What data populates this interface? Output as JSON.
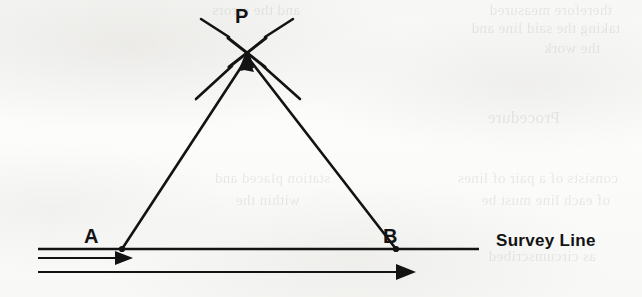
{
  "figure": {
    "kind": "survey-triangulation-diagram",
    "ink_color": "#131313",
    "paper_color": "#f9f9f7",
    "labels": {
      "apex": "P",
      "left_station": "A",
      "right_station": "B",
      "baseline": "Survey Line"
    },
    "geometry": {
      "apex_point": {
        "x": 247,
        "y": 52
      },
      "left_station_point": {
        "x": 122,
        "y": 249
      },
      "right_station_point": {
        "x": 396,
        "y": 249
      },
      "survey_line": {
        "x1": 38,
        "y1": 249,
        "x2": 479,
        "y2": 249
      },
      "offset_line_middle": {
        "x1": 38,
        "y1": 258,
        "x2": 127,
        "y2": 258
      },
      "offset_line_bottom": {
        "x1": 38,
        "y1": 272,
        "x2": 415,
        "y2": 272
      }
    },
    "ticks_at_apex": [
      {
        "name": "upper-left-tick",
        "x1": 200,
        "y1": 18,
        "x2": 228,
        "y2": 36
      },
      {
        "name": "upper-right-tick",
        "x1": 292,
        "y1": 18,
        "x2": 266,
        "y2": 36
      },
      {
        "name": "lower-left-tick",
        "x1": 196,
        "y1": 98,
        "x2": 231,
        "y2": 68
      },
      {
        "name": "lower-right-tick",
        "x1": 299,
        "y1": 98,
        "x2": 264,
        "y2": 68
      }
    ],
    "arrowheads": [
      {
        "name": "arrow-into-apex-from-left",
        "at": "P",
        "direction": "up-right"
      },
      {
        "name": "arrow-into-apex-from-right",
        "at": "P",
        "direction": "up-left"
      },
      {
        "name": "arrow-on-middle-offset-line",
        "at": "A",
        "direction": "right"
      },
      {
        "name": "arrow-on-bottom-offset-line",
        "at": "mid-right",
        "direction": "right"
      }
    ]
  },
  "ghost_text": [
    {
      "text": "therefore measured",
      "x": 612,
      "y": 2,
      "size": 15
    },
    {
      "text": "taking the said line and",
      "x": 620,
      "y": 20,
      "size": 15
    },
    {
      "text": "the work",
      "x": 600,
      "y": 40,
      "size": 15
    },
    {
      "text": "Procedure",
      "x": 560,
      "y": 108,
      "size": 17
    },
    {
      "text": "consists of a pair of lines",
      "x": 618,
      "y": 170,
      "size": 15
    },
    {
      "text": "of each line must be",
      "x": 610,
      "y": 192,
      "size": 15
    },
    {
      "text": "as circumscribed",
      "x": 596,
      "y": 248,
      "size": 15
    },
    {
      "text": "and the errors",
      "x": 300,
      "y": 2,
      "size": 15
    },
    {
      "text": "station placed and",
      "x": 330,
      "y": 170,
      "size": 15
    },
    {
      "text": "within the",
      "x": 300,
      "y": 192,
      "size": 15
    }
  ]
}
